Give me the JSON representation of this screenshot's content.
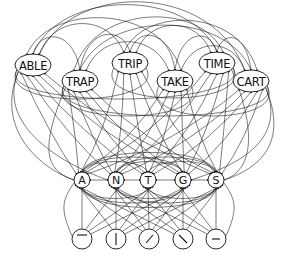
{
  "diagram": {
    "type": "interactive-activation-network",
    "colors": {
      "line": "#111111",
      "background": "#ffffff"
    },
    "word_level": [
      {
        "label": "ABLE",
        "x": 33,
        "y": 65
      },
      {
        "label": "TRAP",
        "x": 80,
        "y": 81
      },
      {
        "label": "TRIP",
        "x": 130,
        "y": 63
      },
      {
        "label": "TAKE",
        "x": 175,
        "y": 81
      },
      {
        "label": "TIME",
        "x": 217,
        "y": 63
      },
      {
        "label": "CART",
        "x": 251,
        "y": 81
      }
    ],
    "letter_level": [
      {
        "label": "A",
        "x": 82,
        "y": 180
      },
      {
        "label": "N",
        "x": 116,
        "y": 180
      },
      {
        "label": "T",
        "x": 148,
        "y": 180
      },
      {
        "label": "G",
        "x": 183,
        "y": 180
      },
      {
        "label": "S",
        "x": 216,
        "y": 180
      }
    ],
    "feature_level": [
      {
        "feature": "horizontal-top-bar",
        "x": 82,
        "y": 239
      },
      {
        "feature": "vertical-bar",
        "x": 116,
        "y": 239
      },
      {
        "feature": "diagonal-right",
        "x": 149,
        "y": 239
      },
      {
        "feature": "diagonal-left",
        "x": 183,
        "y": 239
      },
      {
        "feature": "horizontal-middle-bar",
        "x": 216,
        "y": 239
      }
    ]
  }
}
